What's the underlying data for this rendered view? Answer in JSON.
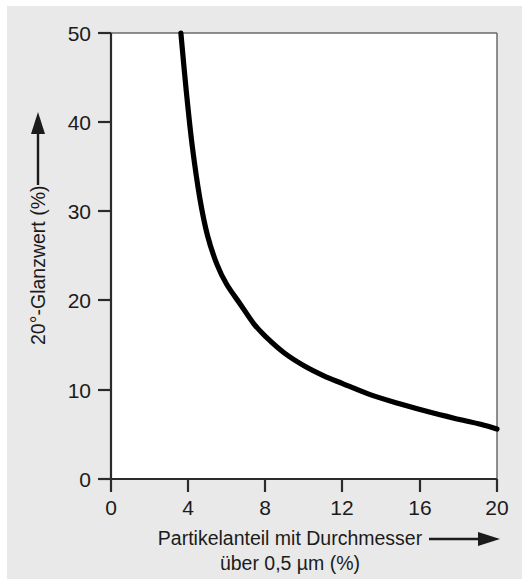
{
  "figure": {
    "background_color": "#e9e9e9",
    "page_color": "#ffffff",
    "plot_area_color": "#ffffff",
    "line_color": "#000000",
    "axis_color": "#2b2b2b"
  },
  "chart_data": {
    "type": "line",
    "title": "",
    "xlabel_line1": "Partikelanteil mit Durchmesser",
    "xlabel_line2": "über 0,5 µm (%)",
    "ylabel": "20°-Glanzwert (%)",
    "xlim": [
      0,
      20
    ],
    "ylim": [
      0,
      50
    ],
    "xticks": [
      0,
      4,
      8,
      12,
      16,
      20
    ],
    "xtick_labels": [
      "0",
      "4",
      "8",
      "12",
      "16",
      "20"
    ],
    "yticks": [
      0,
      10,
      20,
      30,
      40,
      50
    ],
    "ytick_labels": [
      "0",
      "10",
      "20",
      "30",
      "40",
      "50"
    ],
    "grid": false,
    "legend": null,
    "series": [
      {
        "name": "20°-Glanzwert",
        "x": [
          3.62,
          3.9,
          4.2,
          4.6,
          5.0,
          5.5,
          6.0,
          6.7,
          7.4,
          8.0,
          9.0,
          10.0,
          11.0,
          12.0,
          13.5,
          15.0,
          16.5,
          18.0,
          19.2,
          20.0
        ],
        "y": [
          50.0,
          43.5,
          37.5,
          31.5,
          27.3,
          24.0,
          21.8,
          19.6,
          17.4,
          16.0,
          14.1,
          12.7,
          11.6,
          10.7,
          9.4,
          8.4,
          7.5,
          6.7,
          6.1,
          5.6
        ]
      }
    ],
    "annotations": [
      {
        "name": "y-axis-direction-arrow",
        "direction": "up",
        "text": ""
      },
      {
        "name": "x-axis-direction-arrow",
        "direction": "right",
        "text": ""
      }
    ]
  }
}
